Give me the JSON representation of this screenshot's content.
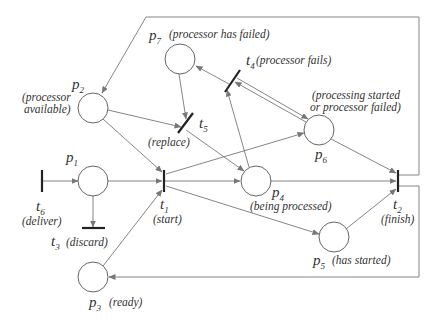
{
  "diagram": {
    "type": "petri-net",
    "places": [
      {
        "id": "p1",
        "name": "p",
        "sub": "1",
        "desc": ""
      },
      {
        "id": "p2",
        "name": "p",
        "sub": "2",
        "desc_lines": [
          "(processor",
          "available)"
        ]
      },
      {
        "id": "p3",
        "name": "p",
        "sub": "3",
        "desc": "(ready)"
      },
      {
        "id": "p4",
        "name": "p",
        "sub": "4",
        "desc": "(being processed)"
      },
      {
        "id": "p5",
        "name": "p",
        "sub": "5",
        "desc": "(has started)"
      },
      {
        "id": "p6",
        "name": "p",
        "sub": "6",
        "desc_lines": [
          "(processing started",
          "or processor failed)"
        ]
      },
      {
        "id": "p7",
        "name": "p",
        "sub": "7",
        "desc": "(processor has failed)"
      }
    ],
    "transitions": [
      {
        "id": "t1",
        "name": "t",
        "sub": "1",
        "desc": "(start)"
      },
      {
        "id": "t2",
        "name": "t",
        "sub": "2",
        "desc": "(finish)"
      },
      {
        "id": "t3",
        "name": "t",
        "sub": "3",
        "desc": "(discard)"
      },
      {
        "id": "t4",
        "name": "t",
        "sub": "4",
        "desc": "(processor fails)"
      },
      {
        "id": "t5",
        "name": "t",
        "sub": "5",
        "desc": "(replace)"
      },
      {
        "id": "t6",
        "name": "t",
        "sub": "6",
        "desc": "(deliver)"
      }
    ],
    "arcs": [
      {
        "from": "t6",
        "to": "p1"
      },
      {
        "from": "p1",
        "to": "t1"
      },
      {
        "from": "p1",
        "to": "t3"
      },
      {
        "from": "p3",
        "to": "t1"
      },
      {
        "from": "p2",
        "to": "t1"
      },
      {
        "from": "p2",
        "to": "t5"
      },
      {
        "from": "p7",
        "to": "t5"
      },
      {
        "from": "t5",
        "to": "p4"
      },
      {
        "from": "t1",
        "to": "p4"
      },
      {
        "from": "t1",
        "to": "p6"
      },
      {
        "from": "t1",
        "to": "p5"
      },
      {
        "from": "p4",
        "to": "t4"
      },
      {
        "from": "t4",
        "to": "p7"
      },
      {
        "from": "p6",
        "to": "t4"
      },
      {
        "from": "t4",
        "to": "p6"
      },
      {
        "from": "p4",
        "to": "t2"
      },
      {
        "from": "p6",
        "to": "t2"
      },
      {
        "from": "p5",
        "to": "t2"
      },
      {
        "from": "t2",
        "to": "p2"
      },
      {
        "from": "t2",
        "to": "p3"
      }
    ]
  }
}
